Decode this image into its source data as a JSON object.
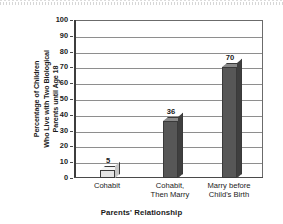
{
  "chart_data": {
    "type": "bar",
    "title": "",
    "categories": [
      "Cohabit",
      "Cohabit,\nThen Marry",
      "Marry before\nChild's Birth"
    ],
    "category_lines": [
      [
        "Cohabit"
      ],
      [
        "Cohabit,",
        "Then Marry"
      ],
      [
        "Marry before",
        "Child's Birth"
      ]
    ],
    "values": [
      5,
      36,
      70
    ],
    "value_labels": [
      "5",
      "36",
      "70"
    ],
    "xlabel": "Parents' Relationship",
    "ylabel": "Percentage of Children Who Live with Two Biological Parents until Age 18",
    "ylabel_lines": [
      "Percentage of Children",
      "Who Live with Two Biological",
      "Parents until Age 18"
    ],
    "ylim": [
      0,
      100
    ],
    "ytick_step": 10,
    "yticks": [
      "100",
      "90",
      "80",
      "70",
      "60",
      "50",
      "40",
      "30",
      "20",
      "10",
      "0"
    ],
    "grid": true,
    "legend": "none",
    "bar_styles": [
      "light",
      "dark",
      "dark"
    ],
    "colors": {
      "bar_dark_face": "#575757",
      "bar_dark_top": "#8a8a8a",
      "bar_dark_side": "#3f3f3f",
      "bar_light_face": "#e4e4e4",
      "bar_light_top": "#f4f4f4",
      "bar_light_side": "#c6c6c6",
      "gridline": "#8e8e8e",
      "axis": "#4a4a4a",
      "text": "#1a1a1a",
      "background": "#ffffff"
    }
  }
}
